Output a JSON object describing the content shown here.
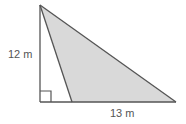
{
  "diagram": {
    "type": "geometry-triangle",
    "height_label": "12 m",
    "base_label": "13 m",
    "colors": {
      "fill": "#d9d9d9",
      "stroke": "#555555",
      "text": "#555555"
    },
    "points": {
      "apex": [
        40,
        5
      ],
      "right_angle_corner": [
        40,
        102
      ],
      "inner_base": [
        72,
        102
      ],
      "far_right": [
        176,
        102
      ]
    }
  }
}
